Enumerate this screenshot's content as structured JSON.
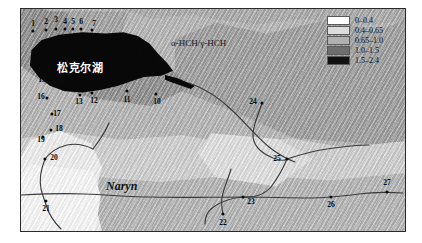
{
  "figure": {
    "lake_label": "松克尔湖",
    "ratio_title": "α-HCH/γ-HCH",
    "river_label": "Naryn"
  },
  "legend": {
    "title": "",
    "items": [
      {
        "label": "0–0.4",
        "color": "#ffffff"
      },
      {
        "label": "0.4–0.65",
        "color": "#dcdcdc"
      },
      {
        "label": "0.65–1.0",
        "color": "#b0b0b0"
      },
      {
        "label": "1.0–1.5",
        "color": "#6e6e6e"
      },
      {
        "label": "1.5–2.4",
        "color": "#111111"
      }
    ]
  },
  "map": {
    "points": [
      {
        "id": "1",
        "label": "1",
        "dx": 12,
        "dy": 22,
        "lx": 12,
        "ly": 15
      },
      {
        "id": "2",
        "label": "2",
        "dx": 25,
        "dy": 21,
        "lx": 25,
        "ly": 13
      },
      {
        "id": "3",
        "label": "3",
        "dx": 35,
        "dy": 20,
        "lx": 35,
        "ly": 11
      },
      {
        "id": "4",
        "label": "4",
        "dx": 44,
        "dy": 20,
        "lx": 44,
        "ly": 13
      },
      {
        "id": "5",
        "label": "5",
        "dx": 52,
        "dy": 20,
        "lx": 52,
        "ly": 13
      },
      {
        "id": "6",
        "label": "6",
        "dx": 60,
        "dy": 20,
        "lx": 60,
        "ly": 13
      },
      {
        "id": "7",
        "label": "7",
        "dx": 71,
        "dy": 21,
        "lx": 73,
        "ly": 15
      },
      {
        "id": "8",
        "label": "8",
        "dx": 121,
        "dy": 54,
        "lx": 120,
        "ly": 45
      },
      {
        "id": "9",
        "label": "9",
        "dx": 138,
        "dy": 60,
        "lx": 137,
        "ly": 50
      },
      {
        "id": "10",
        "label": "10",
        "dx": 135,
        "dy": 85,
        "lx": 136,
        "ly": 93
      },
      {
        "id": "11",
        "label": "11",
        "dx": 106,
        "dy": 82,
        "lx": 106,
        "ly": 91
      },
      {
        "id": "12",
        "label": "12",
        "dx": 71,
        "dy": 84,
        "lx": 73,
        "ly": 92
      },
      {
        "id": "13",
        "label": "13",
        "dx": 59,
        "dy": 86,
        "lx": 58,
        "ly": 93
      },
      {
        "id": "14",
        "label": "14",
        "dx": 42,
        "dy": 80,
        "lx": 40,
        "ly": 73
      },
      {
        "id": "15",
        "label": "15",
        "dx": 25,
        "dy": 71,
        "lx": 21,
        "ly": 71
      },
      {
        "id": "16",
        "label": "16",
        "dx": 26,
        "dy": 89,
        "lx": 20,
        "ly": 88
      },
      {
        "id": "17",
        "label": "17",
        "dx": 31,
        "dy": 105,
        "lx": 36,
        "ly": 105
      },
      {
        "id": "18",
        "label": "18",
        "dx": 30,
        "dy": 121,
        "lx": 38,
        "ly": 120
      },
      {
        "id": "19",
        "label": "19",
        "dx": 22,
        "dy": 128,
        "lx": 20,
        "ly": 131
      },
      {
        "id": "20",
        "label": "20",
        "dx": 24,
        "dy": 150,
        "lx": 33,
        "ly": 149
      },
      {
        "id": "21",
        "label": "21",
        "dx": 25,
        "dy": 192,
        "lx": 25,
        "ly": 200
      },
      {
        "id": "22",
        "label": "22",
        "dx": 202,
        "dy": 205,
        "lx": 202,
        "ly": 214
      },
      {
        "id": "23",
        "label": "23",
        "dx": 222,
        "dy": 188,
        "lx": 230,
        "ly": 193
      },
      {
        "id": "24",
        "label": "24",
        "dx": 241,
        "dy": 94,
        "lx": 232,
        "ly": 93
      },
      {
        "id": "25",
        "label": "25",
        "dx": 266,
        "dy": 150,
        "lx": 256,
        "ly": 150
      },
      {
        "id": "26",
        "label": "26",
        "dx": 310,
        "dy": 188,
        "lx": 310,
        "ly": 196
      },
      {
        "id": "27",
        "label": "27",
        "dx": 366,
        "dy": 183,
        "lx": 366,
        "ly": 174
      }
    ]
  }
}
